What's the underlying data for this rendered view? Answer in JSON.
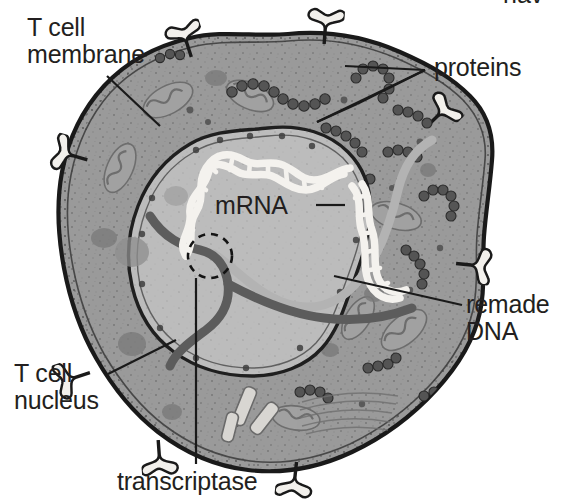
{
  "figure": {
    "kind": "biology-diagram",
    "background_color": "#ffffff",
    "ink_color": "#231f20"
  },
  "labels": {
    "membrane": "T cell\nmembrane",
    "proteins": "proteins",
    "mrna": "mRNA",
    "remade_dna": "remade\nDNA",
    "nucleus": "T cell\nnucleus",
    "transcriptase": "transcriptase",
    "clipped_top": "hav"
  },
  "palette": {
    "cytoplasm": "#9a9a9a",
    "cytoplasm_dark": "#8d8d8d",
    "nucleoplasm": "#bdbdbd",
    "nucleoplasm_light": "#c6c6c6",
    "membrane_line": "#1a1a1a",
    "receptor_fill": "#f2f0ec",
    "ribosome": "#4a4a4a",
    "mitochondria": "#8a8a8a",
    "dna_white": "#f4f2ee",
    "strand_dark": "#595959",
    "strand_mrna": "#b0b0b0"
  },
  "structures": {
    "receptor_spikes": 8,
    "nucleus_present": true,
    "transcriptase_marker": "dashed-circle",
    "dna_strand": "double-helix white",
    "mrna_strand": "light gray ribbon",
    "template_strand": "dark gray ribbon"
  }
}
